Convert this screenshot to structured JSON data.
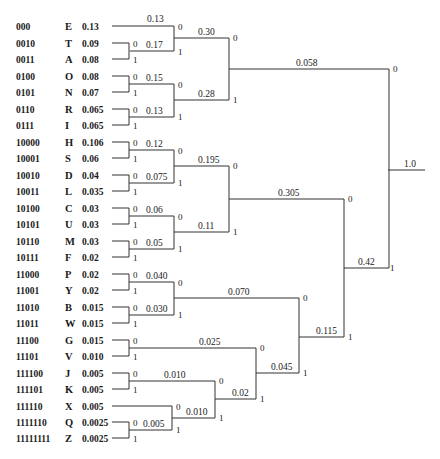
{
  "diagram": {
    "type": "huffman-code-tree",
    "symbols": [
      {
        "code": "000",
        "letter": "E",
        "prob": "0.13"
      },
      {
        "code": "0010",
        "letter": "T",
        "prob": "0.09"
      },
      {
        "code": "0011",
        "letter": "A",
        "prob": "0.08"
      },
      {
        "code": "0100",
        "letter": "O",
        "prob": "0.08"
      },
      {
        "code": "0101",
        "letter": "N",
        "prob": "0.07"
      },
      {
        "code": "0110",
        "letter": "R",
        "prob": "0.065"
      },
      {
        "code": "0111",
        "letter": "I",
        "prob": "0.065"
      },
      {
        "code": "10000",
        "letter": "H",
        "prob": "0.106"
      },
      {
        "code": "10001",
        "letter": "S",
        "prob": "0.06"
      },
      {
        "code": "10010",
        "letter": "D",
        "prob": "0.04"
      },
      {
        "code": "10011",
        "letter": "L",
        "prob": "0.035"
      },
      {
        "code": "10100",
        "letter": "C",
        "prob": "0.03"
      },
      {
        "code": "10101",
        "letter": "U",
        "prob": "0.03"
      },
      {
        "code": "10110",
        "letter": "M",
        "prob": "0.03"
      },
      {
        "code": "10111",
        "letter": "F",
        "prob": "0.02"
      },
      {
        "code": "11000",
        "letter": "P",
        "prob": "0.02"
      },
      {
        "code": "11001",
        "letter": "Y",
        "prob": "0.02"
      },
      {
        "code": "11010",
        "letter": "B",
        "prob": "0.015"
      },
      {
        "code": "11011",
        "letter": "W",
        "prob": "0.015"
      },
      {
        "code": "11100",
        "letter": "G",
        "prob": "0.015"
      },
      {
        "code": "11101",
        "letter": "V",
        "prob": "0.010"
      },
      {
        "code": "111100",
        "letter": "J",
        "prob": "0.005"
      },
      {
        "code": "111101",
        "letter": "K",
        "prob": "0.005"
      },
      {
        "code": "111110",
        "letter": "X",
        "prob": "0.005"
      },
      {
        "code": "1111110",
        "letter": "Q",
        "prob": "0.0025"
      },
      {
        "code": "11111111",
        "letter": "Z",
        "prob": "0.0025"
      }
    ],
    "nodes": {
      "n013": "0.13",
      "n017": "0.17",
      "n015": "0.15",
      "n013b": "0.13",
      "n030": "0.30",
      "n028": "0.28",
      "n0058": "0.058",
      "n012": "0.12",
      "n0075": "0.075",
      "n006": "0.06",
      "n005": "0.05",
      "n0195": "0.195",
      "n011": "0.11",
      "n0305": "0.305",
      "n0040": "0.040",
      "n0030": "0.030",
      "n0070": "0.070",
      "n0025": "0.025",
      "n0010a": "0.010",
      "n0010b": "0.010",
      "n0005": "0.005",
      "n002": "0.02",
      "n0045": "0.045",
      "n0115": "0.115",
      "n042": "0.42",
      "root": "1.0"
    },
    "bits": {
      "zero": "0",
      "one": "1"
    }
  }
}
